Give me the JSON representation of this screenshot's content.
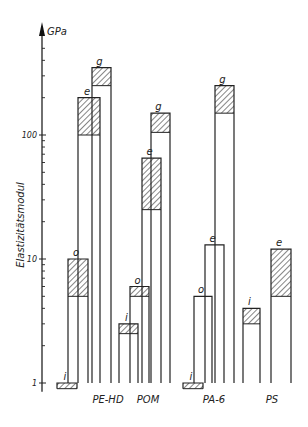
{
  "chart_data": {
    "type": "bar",
    "title": "",
    "ylabel": "Elastizitätsmodul",
    "yunit": "GPa",
    "yscale": "log",
    "ylim": [
      0.9,
      500
    ],
    "yticks": [
      1,
      10,
      100
    ],
    "ytick_labels": [
      "1",
      "10",
      "100"
    ],
    "grid": false,
    "legend": "none; bar letters i, o, e, g annotate each bar",
    "hatch_meaning": "hatched segment shows range (min to max)",
    "categories": [
      "PE-HD",
      "POM",
      "PA-6",
      "PS"
    ],
    "series": [
      {
        "material": "PE-HD",
        "bars": [
          {
            "label": "i",
            "min": 0.9,
            "max": 1.0
          },
          {
            "label": "o",
            "min": 5,
            "max": 10
          },
          {
            "label": "e",
            "min": 100,
            "max": 200
          },
          {
            "label": "g",
            "min": 250,
            "max": 350
          }
        ]
      },
      {
        "material": "POM",
        "bars": [
          {
            "label": "i",
            "min": 2.5,
            "max": 3
          },
          {
            "label": "o",
            "min": 5,
            "max": 6
          },
          {
            "label": "e",
            "min": 25,
            "max": 65
          },
          {
            "label": "g",
            "min": 105,
            "max": 150
          }
        ]
      },
      {
        "material": "PA-6",
        "bars": [
          {
            "label": "i",
            "min": 0.9,
            "max": 1.0
          },
          {
            "label": "o",
            "min": 5,
            "max": 5
          },
          {
            "label": "e",
            "min": 13,
            "max": 13
          },
          {
            "label": "g",
            "min": 150,
            "max": 250
          }
        ]
      },
      {
        "material": "PS",
        "bars": [
          {
            "label": "i",
            "min": 3,
            "max": 4
          },
          {
            "label": "e",
            "min": 5,
            "max": 12
          }
        ]
      }
    ]
  },
  "layout": {
    "axis_x": 42,
    "y_one_px": 383,
    "px_per_decade": 124,
    "baseline_px": 383,
    "bars": [
      {
        "cat": 0,
        "i": 0,
        "x0": 57,
        "x1": 77
      },
      {
        "cat": 0,
        "i": 1,
        "x0": 68,
        "x1": 88
      },
      {
        "cat": 0,
        "i": 2,
        "x0": 78,
        "x1": 100
      },
      {
        "cat": 0,
        "i": 3,
        "x0": 92,
        "x1": 111
      },
      {
        "cat": 1,
        "i": 0,
        "x0": 119,
        "x1": 138
      },
      {
        "cat": 1,
        "i": 1,
        "x0": 130,
        "x1": 149
      },
      {
        "cat": 1,
        "i": 2,
        "x0": 142,
        "x1": 161
      },
      {
        "cat": 1,
        "i": 3,
        "x0": 151,
        "x1": 170
      },
      {
        "cat": 2,
        "i": 0,
        "x0": 183,
        "x1": 203
      },
      {
        "cat": 2,
        "i": 1,
        "x0": 194,
        "x1": 212
      },
      {
        "cat": 2,
        "i": 2,
        "x0": 205,
        "x1": 224
      },
      {
        "cat": 2,
        "i": 3,
        "x0": 215,
        "x1": 234
      },
      {
        "cat": 3,
        "i": 0,
        "x0": 243,
        "x1": 260
      },
      {
        "cat": 3,
        "i": 1,
        "x0": 271,
        "x1": 291
      }
    ],
    "cat_label_x": [
      108,
      148,
      214,
      272
    ],
    "cat_label_y": 403
  }
}
